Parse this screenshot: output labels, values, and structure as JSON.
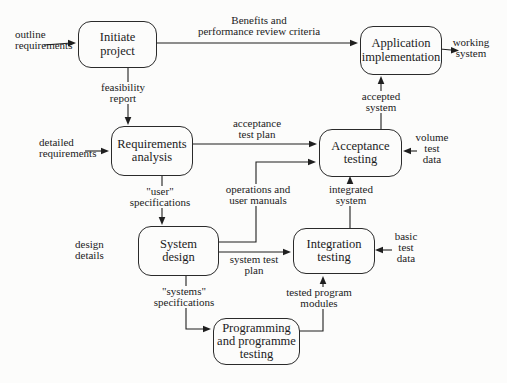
{
  "colors": {
    "background": "#fcfcfb",
    "line": "#1f1f1f",
    "text": "#1b1b1b"
  },
  "boxes": {
    "initiate_project": [
      "Initiate",
      "project"
    ],
    "application_implementation": [
      "Application",
      "implementation"
    ],
    "requirements_analysis": [
      "Requirements",
      "analysis"
    ],
    "acceptance_testing": [
      "Acceptance",
      "testing"
    ],
    "system_design": [
      "System",
      "design"
    ],
    "integration_testing": [
      "Integration",
      "testing"
    ],
    "programming_testing": [
      "Programming",
      "and programme",
      "testing"
    ]
  },
  "labels": {
    "outline_requirements": [
      "outline",
      "requirements"
    ],
    "benefits_criteria": [
      "Benefits and",
      "performance review criteria"
    ],
    "working_system": [
      "working",
      "system"
    ],
    "feasibility_report": [
      "feasibility",
      "report"
    ],
    "detailed_requirements": [
      "detailed",
      "requirements"
    ],
    "acceptance_test_plan": [
      "acceptance",
      "test plan"
    ],
    "user_specifications": [
      "\"user\"",
      "specifications"
    ],
    "operations_user_manuals": [
      "operations and",
      "user manuals"
    ],
    "volume_test_data": [
      "volume",
      "test",
      "data"
    ],
    "accepted_system": [
      "accepted",
      "system"
    ],
    "integrated_system": [
      "integrated",
      "system"
    ],
    "design_details": [
      "design",
      "details"
    ],
    "system_test_plan": [
      "system test",
      "plan"
    ],
    "basic_test_data": [
      "basic",
      "test",
      "data"
    ],
    "systems_specifications": [
      "\"systems\"",
      "specifications"
    ],
    "tested_program_modules": [
      "tested program",
      "modules"
    ]
  }
}
